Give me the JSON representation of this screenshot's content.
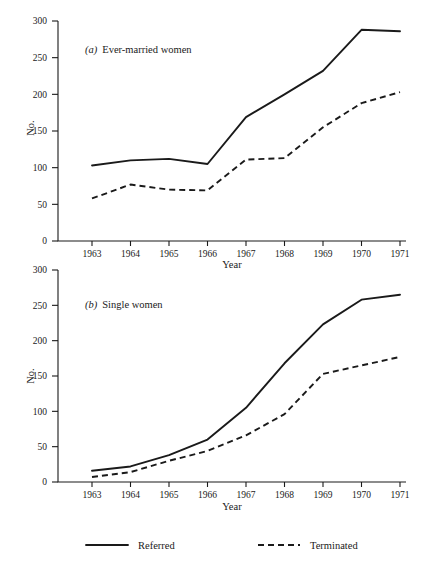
{
  "figure": {
    "xlabel": "Year",
    "ylabel": "No.",
    "panel_a_label": "(a)",
    "panel_a_title": "Ever-married women",
    "panel_b_label": "(b)",
    "panel_b_title": "Single women",
    "legend": {
      "referred": "Referred",
      "terminated": "Terminated"
    },
    "line_color": "#1a1a1a",
    "background": "#ffffff"
  },
  "axes": {
    "yticks": [
      0,
      50,
      100,
      150,
      200,
      250,
      300
    ],
    "ytick_labels": [
      "0",
      "50",
      "100",
      "150",
      "200",
      "250",
      "300"
    ],
    "xticks": [
      1963,
      1964,
      1965,
      1966,
      1967,
      1968,
      1969,
      1970,
      1971
    ],
    "xtick_labels": [
      "1963",
      "1964",
      "1965",
      "1966",
      "1967",
      "1968",
      "1969",
      "1970",
      "1971"
    ]
  },
  "chart_data": [
    {
      "type": "line",
      "title": "(a) Ever-married women",
      "panel": "a",
      "xlabel": "Year",
      "ylabel": "No.",
      "categories": [
        1963,
        1964,
        1965,
        1966,
        1967,
        1968,
        1969,
        1970,
        1971
      ],
      "xlim": [
        1963,
        1971
      ],
      "ylim": [
        0,
        300
      ],
      "grid": false,
      "legend_position": "below-figure",
      "series": [
        {
          "name": "Referred",
          "style": "solid",
          "values": [
            103,
            110,
            112,
            105,
            169,
            200,
            232,
            288,
            286
          ]
        },
        {
          "name": "Terminated",
          "style": "dashed",
          "values": [
            58,
            77,
            70,
            69,
            111,
            113,
            155,
            188,
            203
          ]
        }
      ]
    },
    {
      "type": "line",
      "title": "(b) Single women",
      "panel": "b",
      "xlabel": "Year",
      "ylabel": "No.",
      "categories": [
        1963,
        1964,
        1965,
        1966,
        1967,
        1968,
        1969,
        1970,
        1971
      ],
      "xlim": [
        1963,
        1971
      ],
      "ylim": [
        0,
        300
      ],
      "grid": false,
      "legend_position": "below-figure",
      "series": [
        {
          "name": "Referred",
          "style": "solid",
          "values": [
            16,
            22,
            38,
            60,
            105,
            168,
            223,
            258,
            265
          ]
        },
        {
          "name": "Terminated",
          "style": "dashed",
          "values": [
            7,
            14,
            30,
            44,
            66,
            96,
            153,
            165,
            177
          ]
        }
      ]
    }
  ]
}
